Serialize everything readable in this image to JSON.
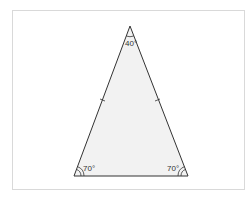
{
  "diagram": {
    "type": "isosceles-triangle",
    "fill_color": "#f2f2f2",
    "stroke_color": "#333333",
    "vertices": {
      "apex": {
        "angle_label": "40°"
      },
      "bottom_left": {
        "angle_label": "70°"
      },
      "bottom_right": {
        "angle_label": "70°"
      }
    },
    "equal_sides_tick_marks": 1
  }
}
